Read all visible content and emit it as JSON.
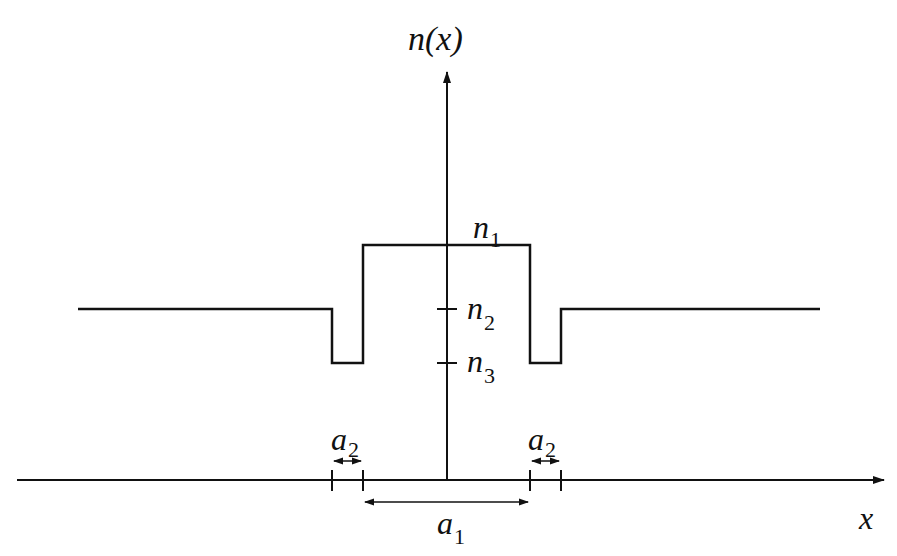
{
  "diagram": {
    "type": "refractive-index-profile",
    "colors": {
      "line": "#111111",
      "background": "#ffffff"
    },
    "axes": {
      "y_label": {
        "base": "n(x)"
      },
      "x_label": {
        "base": "x"
      }
    },
    "levels": [
      {
        "name": "n1",
        "base": "n",
        "sub": "1",
        "role": "core index"
      },
      {
        "name": "n2",
        "base": "n",
        "sub": "2",
        "role": "cladding index"
      },
      {
        "name": "n3",
        "base": "n",
        "sub": "3",
        "role": "depressed well index"
      }
    ],
    "dimensions": [
      {
        "name": "a2-left",
        "base": "a",
        "sub": "2",
        "role": "left well width"
      },
      {
        "name": "a2-right",
        "base": "a",
        "sub": "2",
        "role": "right well width"
      },
      {
        "name": "a1",
        "base": "a",
        "sub": "1",
        "role": "core width"
      }
    ]
  }
}
